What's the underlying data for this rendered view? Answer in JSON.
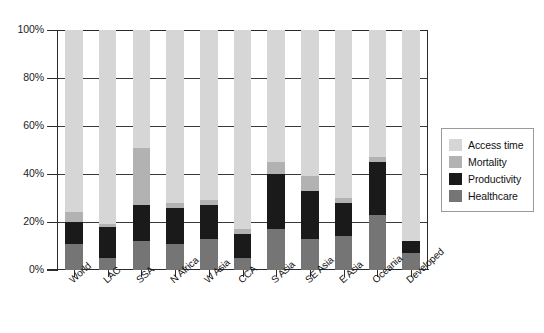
{
  "chart_data": {
    "type": "bar",
    "subtype": "stacked-bar-100-percent",
    "title": "",
    "xlabel": "",
    "ylabel": "",
    "ylim": [
      0,
      100
    ],
    "ytick_labels": [
      "0%",
      "20%",
      "40%",
      "60%",
      "80%",
      "100%"
    ],
    "ytick_values": [
      0,
      20,
      40,
      60,
      80,
      100
    ],
    "grid": "horizontal",
    "legend_position": "right",
    "categories": [
      "World",
      "LAC",
      "SSA",
      "N Africa",
      "W Asia",
      "CCA",
      "S Asia",
      "SE Asia",
      "E Asia",
      "Oceania",
      "Developed"
    ],
    "series": [
      {
        "name": "Healthcare",
        "color": "#757575",
        "values": [
          11,
          5,
          12,
          11,
          13,
          5,
          17,
          13,
          14,
          23,
          7
        ]
      },
      {
        "name": "Productivity",
        "color": "#1a1a1a",
        "values": [
          9,
          13,
          15,
          15,
          14,
          10,
          23,
          20,
          14,
          22,
          5
        ]
      },
      {
        "name": "Mortality",
        "color": "#b2b2b2",
        "values": [
          4,
          1,
          24,
          2,
          2,
          2,
          5,
          6,
          2,
          2,
          0
        ]
      },
      {
        "name": "Access time",
        "color": "#d6d6d6",
        "values": [
          76,
          81,
          49,
          72,
          71,
          83,
          55,
          61,
          70,
          53,
          88
        ]
      }
    ]
  },
  "legend": {
    "entries": [
      {
        "label": "Access time",
        "color": "#d6d6d6"
      },
      {
        "label": "Mortality",
        "color": "#b2b2b2"
      },
      {
        "label": "Productivity",
        "color": "#1a1a1a"
      },
      {
        "label": "Healthcare",
        "color": "#757575"
      }
    ]
  }
}
